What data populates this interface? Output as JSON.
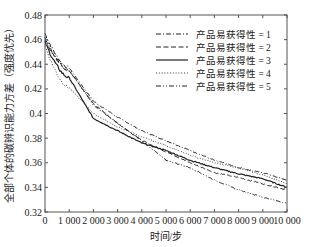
{
  "chart_data": {
    "type": "line",
    "title": "",
    "xlabel": "时间/步",
    "ylabel": "全部个体的碳辨识能力方差（强度优先）",
    "xlim": [
      0,
      10000
    ],
    "ylim": [
      0.32,
      0.48
    ],
    "grid": false,
    "legend_position": "upper right",
    "x_ticks": [
      "0",
      "1 000",
      "2 000",
      "3 000",
      "4 000",
      "5 000",
      "6 000",
      "7 000",
      "8 000",
      "9 000",
      "10 000"
    ],
    "y_ticks": [
      "0.32",
      "0.34",
      "0.36",
      "0.38",
      "0.4",
      "0.42",
      "0.44",
      "0.46",
      "0.48"
    ],
    "x": [
      0,
      1000,
      2000,
      3000,
      4000,
      5000,
      6000,
      7000,
      8000,
      9000,
      10000
    ],
    "series": [
      {
        "name": "产品易获得性 = 1",
        "style": "dash-dot",
        "values": [
          0.465,
          0.437,
          0.41,
          0.397,
          0.386,
          0.378,
          0.37,
          0.362,
          0.356,
          0.352,
          0.346
        ]
      },
      {
        "name": "产品易获得性 = 2",
        "style": "dashed",
        "values": [
          0.46,
          0.435,
          0.408,
          0.392,
          0.378,
          0.369,
          0.36,
          0.352,
          0.348,
          0.343,
          0.338
        ]
      },
      {
        "name": "产品易获得性 = 3",
        "style": "solid",
        "values": [
          0.458,
          0.429,
          0.396,
          0.386,
          0.376,
          0.37,
          0.362,
          0.356,
          0.351,
          0.347,
          0.34
        ]
      },
      {
        "name": "产品易获得性 = 4",
        "style": "dotted",
        "values": [
          0.455,
          0.421,
          0.4,
          0.389,
          0.381,
          0.374,
          0.366,
          0.36,
          0.356,
          0.35,
          0.343
        ]
      },
      {
        "name": "产品易获得性 = 5",
        "style": "dash-dot-dot",
        "values": [
          0.462,
          0.435,
          0.407,
          0.392,
          0.378,
          0.362,
          0.356,
          0.346,
          0.338,
          0.332,
          0.327
        ]
      }
    ]
  }
}
